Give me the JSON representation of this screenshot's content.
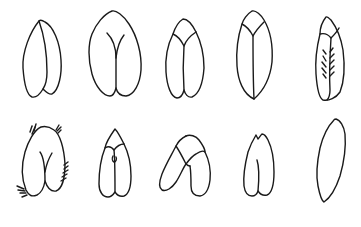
{
  "figure": {
    "background": "#ffffff",
    "stroke_color": "#1a1a1a",
    "layout": {
      "rows": 2,
      "columns": 5
    },
    "items": [
      {
        "row": 1,
        "col": 1,
        "shape": "two-lobed-seed-split-right"
      },
      {
        "row": 1,
        "col": 2,
        "shape": "heart-seed-y-cleft"
      },
      {
        "row": 1,
        "col": 3,
        "shape": "two-lobed-seed-with-cap"
      },
      {
        "row": 1,
        "col": 4,
        "shape": "lanceolate-seed-with-cap-midline"
      },
      {
        "row": 1,
        "col": 5,
        "shape": "seed-with-cap-and-herringbone-hairs"
      },
      {
        "row": 2,
        "col": 1,
        "shape": "hairy-heart-seed-y-cleft"
      },
      {
        "row": 2,
        "col": 2,
        "shape": "two-lobed-seed-pointed-cap-knot"
      },
      {
        "row": 2,
        "col": 3,
        "shape": "tilted-two-lobed-seed-with-cap"
      },
      {
        "row": 2,
        "col": 4,
        "shape": "notched-tip-seed-partial-midline"
      },
      {
        "row": 2,
        "col": 5,
        "shape": "narrow-elliptic-seed"
      }
    ]
  }
}
